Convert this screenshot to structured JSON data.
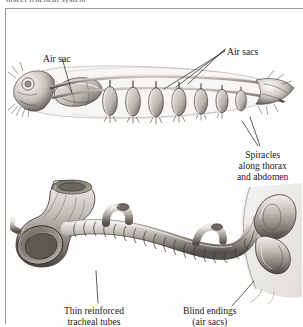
{
  "figure": {
    "caption_sliver": "insect tracheal system",
    "colors": {
      "ink": "#1c1a17",
      "frame_rule": "#9a9a97",
      "leader_line": "#2a2724",
      "illustration_dark": "#3a3633",
      "illustration_mid": "#8d8882",
      "illustration_light": "#d8d4cf",
      "page": "#ffffff"
    },
    "labels": [
      {
        "name": "air-sac",
        "lines": [
          "Air sac"
        ],
        "align": "left",
        "leader_count": 1,
        "points_to": "large air sac in thorax of upper illustration"
      },
      {
        "name": "air-sacs",
        "lines": [
          "Air sacs"
        ],
        "align": "left",
        "leader_count": 3,
        "points_to": "row of paired abdominal air sacs in upper illustration"
      },
      {
        "name": "spiracles-along-thorax-and-abdomen",
        "lines": [
          "Spiracles",
          "along thorax",
          "and abdomen"
        ],
        "align": "center",
        "leader_count": 2,
        "points_to": "spiracle openings along body wall"
      },
      {
        "name": "thin-reinforced-tracheal-tubes",
        "lines": [
          "Thin reinforced",
          "tracheal tubes"
        ],
        "align": "center",
        "leader_count": 1,
        "points_to": "ringed tracheal tube in lower illustration"
      },
      {
        "name": "blind-endings-air-sacs",
        "lines": [
          "Blind endings",
          "(air sacs)"
        ],
        "align": "center",
        "leader_count": 1,
        "points_to": "blind terminal sac at right of lower illustration"
      }
    ],
    "illustrations": [
      {
        "name": "whole-insect-tracheal-system",
        "position": "upper",
        "description": "Pen-and-ink lateral view of an insect with head at left and abdomen extending to the right, showing the branching tracheal trunks, the large thoracic air sac, and a repeated series of paired abdominal air sacs hanging below the longitudinal trunk.",
        "air_sac_pair_count": 7
      },
      {
        "name": "tracheal-tube-detail",
        "position": "lower",
        "description": "Enlarged pencil-shaded detail of a cut tracheal trunk: a wide open-mouthed tube at left branching into a narrower ringed (taenidia-reinforced) tube that runs right, with small side branches and a blind terminal air sac meeting the body wall at the right.",
        "side_branch_count": 3
      }
    ]
  }
}
